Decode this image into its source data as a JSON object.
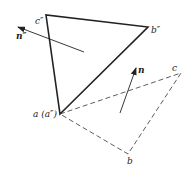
{
  "diagram": {
    "type": "geometry-projection",
    "colors": {
      "line": "#222222",
      "background": "#ffffff"
    },
    "points": {
      "c2": {
        "x": 46,
        "y": 15
      },
      "b2": {
        "x": 148,
        "y": 27
      },
      "a": {
        "x": 60,
        "y": 114
      },
      "c": {
        "x": 181,
        "y": 73
      },
      "b": {
        "x": 128,
        "y": 154
      }
    },
    "labels": {
      "c2": "c″",
      "b2": "b″",
      "a": "a (a″)",
      "c": "c",
      "b": "b",
      "n2": "n″",
      "n": "n"
    },
    "solid_triangle": [
      "a",
      "b2",
      "c2"
    ],
    "dashed_triangle": [
      "a",
      "c",
      "b"
    ],
    "vectors": [
      {
        "name": "n2",
        "from": [
          84,
          52
        ],
        "to": [
          18,
          27
        ]
      },
      {
        "name": "n",
        "from": [
          120,
          113
        ],
        "to": [
          136,
          68
        ]
      }
    ]
  }
}
